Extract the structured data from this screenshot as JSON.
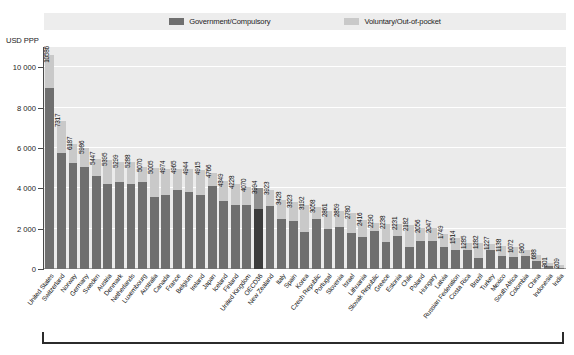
{
  "legend": {
    "items": [
      {
        "label": "Government/Compulsory",
        "color": "#6f6f6f",
        "key": "government"
      },
      {
        "label": "Voluntary/Out-of-pocket",
        "color": "#c9c9c9",
        "key": "voluntary"
      }
    ]
  },
  "axis": {
    "y_title": "USD PPP",
    "y_ticks": [
      "0",
      "2 000",
      "4 000",
      "6 000",
      "8 000",
      "10 000"
    ]
  },
  "colors": {
    "plot_background": "#ebebeb",
    "gridline": "#ffffff",
    "government": "#6f6f6f",
    "voluntary": "#c9c9c9",
    "highlight_government": "#3c3c3c",
    "highlight_voluntary": "#8f8f8f",
    "axis": "#4a4a4a"
  },
  "chart_data": {
    "type": "bar",
    "subtype": "stacked-column",
    "title": "",
    "xlabel": "",
    "ylabel": "USD PPP",
    "ylim": [
      0,
      11000
    ],
    "yticks": [
      0,
      2000,
      4000,
      6000,
      8000,
      10000
    ],
    "grid": true,
    "legend_position": "top",
    "categories": [
      "United States",
      "Switzerland",
      "Norway",
      "Germany",
      "Sweden",
      "Austria",
      "Denmark",
      "Netherlands",
      "Luxembourg",
      "Australia",
      "Canada",
      "France",
      "Belgium",
      "Ireland",
      "Japan",
      "Iceland",
      "Finland",
      "United Kingdom",
      "OECD36",
      "New Zealand",
      "Italy",
      "Spain",
      "Korea",
      "Czech Republic",
      "Portugal",
      "Slovenia",
      "Israel",
      "Lithuania",
      "Slovak Republic",
      "Greece",
      "Estonia",
      "Chile",
      "Poland",
      "Hungary",
      "Latvia",
      "Russian Federation",
      "Costa Rica",
      "Brazil",
      "Turkey",
      "Mexico",
      "South Africa",
      "Colombia",
      "China",
      "Indonesia",
      "India"
    ],
    "totals": [
      10586,
      7317,
      6187,
      5986,
      5447,
      5395,
      5299,
      5288,
      5070,
      5005,
      4974,
      4965,
      4944,
      4915,
      4766,
      4349,
      4228,
      4070,
      3994,
      3923,
      3428,
      3323,
      3192,
      3058,
      2861,
      2859,
      2780,
      2416,
      2290,
      2238,
      2231,
      2182,
      2056,
      2047,
      1749,
      1514,
      1285,
      1282,
      1227,
      1138,
      1072,
      960,
      688,
      301,
      209
    ],
    "series": [
      {
        "name": "Government/Compulsory",
        "values": [
          8949,
          5758,
          5232,
          5059,
          4587,
          4200,
          4330,
          4211,
          4309,
          3567,
          3654,
          3910,
          3822,
          3662,
          4114,
          3393,
          3168,
          3160,
          2974,
          3109,
          2480,
          2376,
          1851,
          2479,
          2002,
          2070,
          1763,
          1602,
          1879,
          1334,
          1644,
          1090,
          1409,
          1378,
          1094,
          941,
          945,
          529,
          948,
          663,
          578,
          669,
          398,
          144,
          59
        ]
      },
      {
        "name": "Voluntary/Out-of-pocket",
        "values": [
          1637,
          1559,
          955,
          927,
          860,
          1195,
          969,
          1077,
          761,
          1438,
          1320,
          1055,
          1122,
          1253,
          652,
          956,
          1060,
          910,
          1020,
          814,
          948,
          947,
          1341,
          579,
          859,
          789,
          1017,
          814,
          411,
          904,
          587,
          1092,
          647,
          669,
          655,
          573,
          340,
          753,
          279,
          475,
          494,
          291,
          290,
          157,
          150
        ]
      }
    ],
    "highlighted_category": "OECD36"
  }
}
